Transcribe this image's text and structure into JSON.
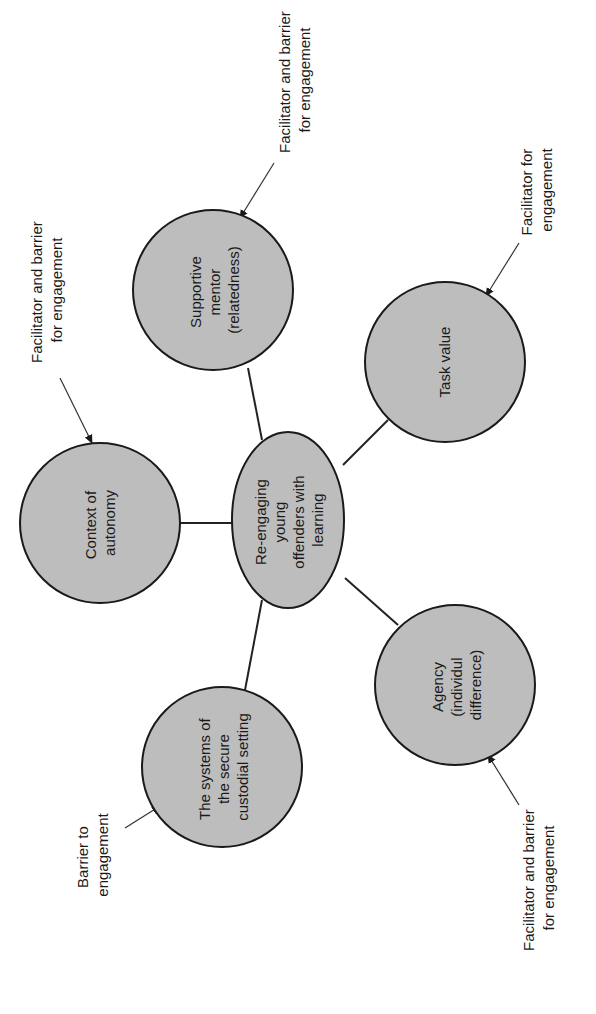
{
  "diagram": {
    "orientation": "rotated -90 degrees",
    "colors": {
      "node_fill": "#bdbdbd",
      "node_stroke": "#1a1a1a",
      "background": "#ffffff"
    },
    "center": {
      "lines": [
        "Re-engaging",
        "young",
        "offenders with",
        "learning"
      ]
    },
    "nodes": [
      {
        "id": "context",
        "lines": [
          "Context of",
          "autonomy"
        ],
        "annotation": [
          "Facilitator and barrier",
          "for engagement"
        ]
      },
      {
        "id": "mentor",
        "lines": [
          "Supportive",
          "mentor",
          "(relatedness)"
        ],
        "annotation": [
          "Facilitator and barrier",
          "for engagement"
        ]
      },
      {
        "id": "task",
        "lines": [
          "Task value"
        ],
        "annotation": [
          "Facilitator for",
          "engagement"
        ]
      },
      {
        "id": "agency",
        "lines": [
          "Agency",
          "(individul",
          "difference)"
        ],
        "annotation": [
          "Facilitator and barrier",
          "for engagement"
        ]
      },
      {
        "id": "systems",
        "lines": [
          "The systems of",
          "the secure",
          "custodial setting"
        ],
        "annotation": [
          "Barrier to",
          "engagement"
        ]
      }
    ]
  }
}
